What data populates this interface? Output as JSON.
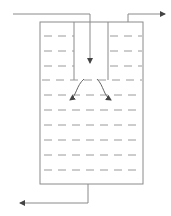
{
  "diagram": {
    "type": "settling-tank-schematic",
    "colors": {
      "line": "#8a8a8a",
      "dash": "#9a9a9a",
      "arrow": "#444444",
      "background": "#ffffff"
    },
    "tank": {
      "x": 40,
      "y": 22,
      "width": 103,
      "height": 162
    },
    "inner_tube": {
      "x1": 74,
      "x2": 108,
      "y_top": 22,
      "y_bottom": 80
    },
    "inlet": {
      "points": [
        [
          13,
          14
        ],
        [
          90,
          14
        ],
        [
          90,
          63
        ]
      ],
      "label": ""
    },
    "top_outlet": {
      "points": [
        [
          128,
          22
        ],
        [
          128,
          14
        ],
        [
          165,
          14
        ]
      ],
      "label": ""
    },
    "bottom_outlet": {
      "points": [
        [
          88,
          184
        ],
        [
          88,
          203
        ],
        [
          20,
          203
        ]
      ],
      "label": ""
    },
    "liquid_levels_y": [
      36,
      51,
      66,
      80,
      95,
      110,
      125,
      140,
      155,
      170
    ],
    "flow_arrows": [
      {
        "name": "left-deflection",
        "d": "M84,79 C76,86 77,95 70,100"
      },
      {
        "name": "right-deflection",
        "d": "M97,79 C104,86 103,95 111,100"
      }
    ]
  }
}
